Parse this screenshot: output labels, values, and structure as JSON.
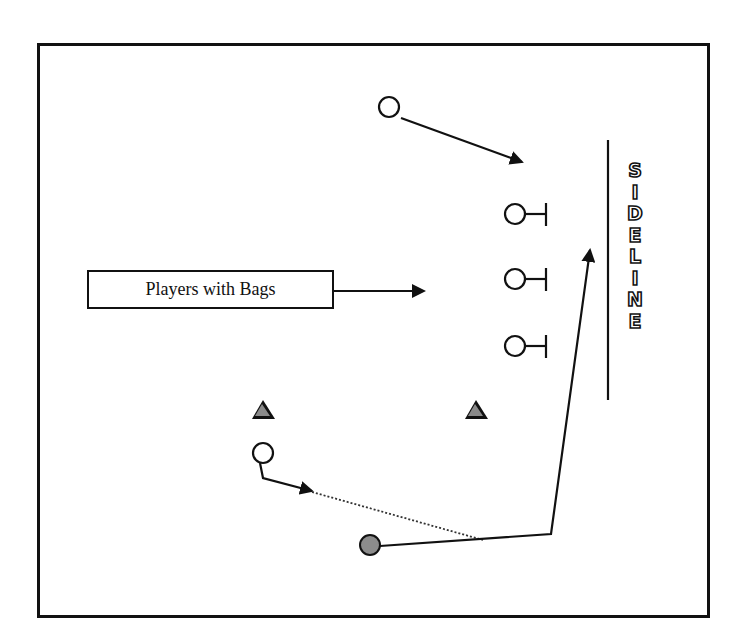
{
  "diagram": {
    "label_box": {
      "text": "Players with Bags"
    },
    "sideline": {
      "letters": [
        "S",
        "I",
        "D",
        "E",
        "L",
        "I",
        "N",
        "E"
      ]
    },
    "caption": {
      "text": ""
    },
    "colors": {
      "line": "#111111",
      "cone_fill": "#8a8a8a",
      "ball_carrier_fill": "#8c8c8c",
      "background": "#ffffff"
    },
    "elements": {
      "top_player": {
        "cx": 389,
        "cy": 107,
        "r": 10,
        "route_to": [
          520,
          162
        ]
      },
      "bag_players": [
        {
          "cx": 515,
          "cy": 214,
          "r": 10
        },
        {
          "cx": 515,
          "cy": 279,
          "r": 10
        },
        {
          "cx": 515,
          "cy": 346,
          "r": 10
        }
      ],
      "cones": [
        {
          "cx": 263,
          "cy": 410
        },
        {
          "cx": 476,
          "cy": 410
        }
      ],
      "lower_player": {
        "cx": 263,
        "cy": 453,
        "r": 10
      },
      "ball_carrier": {
        "cx": 370,
        "cy": 545,
        "r": 10
      },
      "sideline_line": {
        "x": 608,
        "y1": 140,
        "y2": 400
      }
    }
  }
}
